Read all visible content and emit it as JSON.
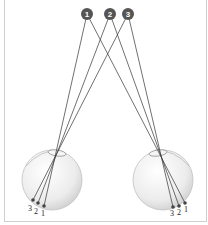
{
  "diagram": {
    "objects": [
      {
        "id": "obj-1",
        "label": "1",
        "x": 87,
        "y": 14
      },
      {
        "id": "obj-2",
        "label": "2",
        "x": 110,
        "y": 14
      },
      {
        "id": "obj-3",
        "label": "3",
        "x": 128,
        "y": 14
      }
    ],
    "left_eye": {
      "center": [
        52,
        180
      ],
      "radius": 30,
      "lens": [
        56,
        152
      ],
      "retina_points": [
        {
          "label": "1",
          "x": 44,
          "y": 206
        },
        {
          "label": "2",
          "x": 38,
          "y": 203
        },
        {
          "label": "3",
          "x": 33,
          "y": 200
        }
      ]
    },
    "right_eye": {
      "center": [
        163,
        180
      ],
      "radius": 30,
      "lens": [
        159,
        152
      ],
      "retina_points": [
        {
          "label": "3",
          "x": 173,
          "y": 207
        },
        {
          "label": "2",
          "x": 179,
          "y": 206
        },
        {
          "label": "1",
          "x": 185,
          "y": 203
        }
      ]
    },
    "colors": {
      "circle": "#555555",
      "ray": "#333333",
      "eye_fill": "#e6e6e6",
      "eye_stroke": "#bdbdbd",
      "border": "#cfcfcf"
    }
  }
}
